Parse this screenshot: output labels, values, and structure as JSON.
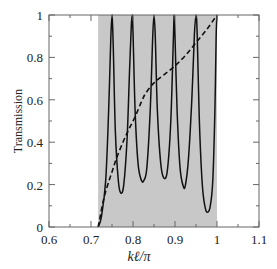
{
  "chart_data": {
    "type": "line",
    "title": "",
    "xlabel": "kℓ/π",
    "ylabel": "Transmission",
    "xlim": [
      0.6,
      1.1
    ],
    "ylim": [
      0,
      1
    ],
    "x_ticks": [
      "0.6",
      "0.7",
      "0.8",
      "0.9",
      "1",
      "1.1"
    ],
    "y_ticks": [
      "0",
      "0.2",
      "0.4",
      "0.6",
      "0.8",
      "1"
    ],
    "grid": false,
    "legend": null,
    "shaded_region": {
      "x_start": 0.717,
      "x_end": 1.0,
      "color": "#c8c8c8"
    },
    "series": [
      {
        "name": "solid",
        "style": "solid",
        "color": "#111111",
        "x": [
          0.717,
          0.725,
          0.735,
          0.742,
          0.747,
          0.75,
          0.753,
          0.758,
          0.765,
          0.771,
          0.778,
          0.786,
          0.792,
          0.796,
          0.798,
          0.8,
          0.805,
          0.812,
          0.82,
          0.826,
          0.833,
          0.841,
          0.847,
          0.85,
          0.853,
          0.858,
          0.866,
          0.874,
          0.882,
          0.89,
          0.896,
          0.898,
          0.9,
          0.905,
          0.912,
          0.92,
          0.925,
          0.932,
          0.94,
          0.946,
          0.95,
          0.953,
          0.958,
          0.965,
          0.972,
          0.978,
          0.984,
          0.99,
          0.995,
          0.998,
          1.0
        ],
        "y": [
          0.0,
          0.05,
          0.22,
          0.55,
          0.88,
          1.0,
          0.85,
          0.45,
          0.22,
          0.16,
          0.2,
          0.42,
          0.75,
          0.95,
          1.0,
          0.92,
          0.55,
          0.3,
          0.22,
          0.22,
          0.28,
          0.55,
          0.9,
          1.0,
          0.9,
          0.55,
          0.3,
          0.23,
          0.27,
          0.5,
          0.88,
          1.0,
          0.9,
          0.55,
          0.28,
          0.19,
          0.2,
          0.32,
          0.6,
          0.9,
          1.0,
          0.9,
          0.5,
          0.2,
          0.09,
          0.07,
          0.1,
          0.22,
          0.55,
          0.9,
          1.0
        ]
      },
      {
        "name": "dashed",
        "style": "dashed",
        "color": "#111111",
        "x": [
          0.717,
          0.72,
          0.73,
          0.74,
          0.75,
          0.76,
          0.776,
          0.79,
          0.805,
          0.82,
          0.83,
          0.85,
          0.875,
          0.9,
          0.925,
          0.95,
          0.975,
          1.0
        ],
        "y": [
          0.0,
          0.03,
          0.13,
          0.2,
          0.26,
          0.32,
          0.4,
          0.46,
          0.52,
          0.59,
          0.63,
          0.68,
          0.72,
          0.76,
          0.81,
          0.87,
          0.93,
          1.0
        ]
      }
    ]
  }
}
